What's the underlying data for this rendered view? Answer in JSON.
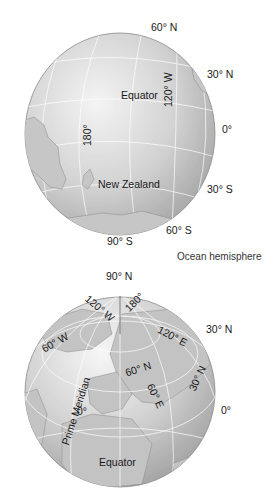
{
  "ocean_hemisphere": {
    "caption": "Ocean hemisphere",
    "labels": {
      "lat_60n": "60° N",
      "lat_30n": "30° N",
      "lat_0": "0°",
      "lat_30s": "30° S",
      "lat_60s": "60° S",
      "lat_90s": "90° S",
      "equator": "Equator",
      "lon_120w": "120° W",
      "lon_180": "180°",
      "new_zealand": "New Zealand"
    }
  },
  "land_hemisphere": {
    "labels": {
      "lat_90n": "90° N",
      "lat_30n_edge": "30° N",
      "lat_0": "0°",
      "lon_120w": "120° W",
      "lon_180": "180°",
      "lon_60w": "60° W",
      "lon_120e": "120° E",
      "lat_60n": "60° N",
      "lat_30n": "30° N",
      "lon_60e": "60° E",
      "prime_meridian": "Prime Meridian",
      "lon_0": "0°",
      "equator": "Equator"
    }
  },
  "colors": {
    "globe_light": "#f2f2f2",
    "globe_mid": "#d4d4d4",
    "globe_dark": "#a8a8a8",
    "grid": "#ffffff",
    "land": "#c4c4c4",
    "outline": "#777777"
  }
}
